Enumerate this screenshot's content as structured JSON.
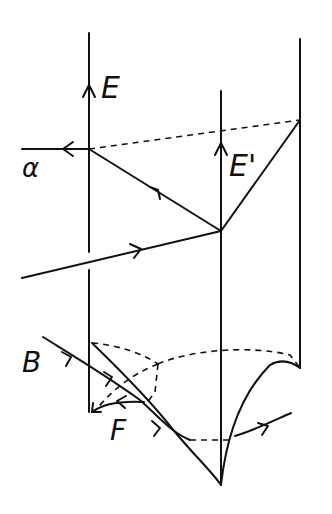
{
  "diagram": {
    "type": "hand-drawn surface/ray diagram",
    "labels": {
      "E": "E",
      "E_prime": "E'",
      "alpha": "α",
      "beta": "B",
      "F": "F"
    },
    "colors": {
      "ink": "#111111",
      "background": "#ffffff"
    }
  }
}
